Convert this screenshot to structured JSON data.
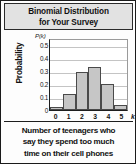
{
  "figure": {
    "title_line1": "Binomial Distribution",
    "title_line2": "for Your Survey",
    "caption_line1": "Number of teenagers who",
    "caption_line2": "say they spend too much",
    "caption_line3": "time on their cell phones",
    "axis_variable": "k",
    "pk_label": "P(k)",
    "ylabel": "Probability",
    "colors": {
      "bar_fill": "#c6c6c6",
      "bar_stroke": "#4a4a4a",
      "grid": "#c4c4c4",
      "axis": "#1d1d1d",
      "title_background": "#e2e2e2",
      "frame": "#1a1a1a",
      "text": "#111111"
    }
  },
  "chart_data": {
    "type": "bar",
    "title": "Binomial Distribution for Your Survey",
    "subtitle": "",
    "xlabel": "k",
    "ylabel": "Probability",
    "categories": [
      "0",
      "1",
      "2",
      "3",
      "4",
      "5"
    ],
    "values": [
      0.02,
      0.12,
      0.29,
      0.33,
      0.2,
      0.04
    ],
    "ylim": [
      0,
      0.55
    ],
    "ytick_labels": [
      "0",
      "0.1",
      "0.2",
      "0.3",
      "0.4",
      "0.5"
    ],
    "ytick_values": [
      0,
      0.1,
      0.2,
      0.3,
      0.4,
      0.5
    ],
    "xtick_labels": [
      "0",
      "1",
      "2",
      "3",
      "4",
      "5"
    ],
    "grid": true,
    "legend": false,
    "annotations": [
      "P(k)"
    ],
    "caption": "Number of teenagers who say they spend too much time on their cell phones"
  }
}
